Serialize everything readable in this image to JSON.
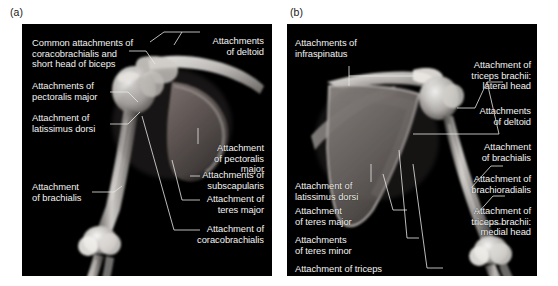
{
  "figure": {
    "type": "anatomy-radiograph-figure",
    "background_color": "#ffffff",
    "panel_background": "#000000",
    "label_text_color": "#f2f2f0",
    "leader_line_color": "#e8e8e6"
  },
  "panels": [
    {
      "letter": "(a)",
      "id": "panel-a",
      "view": "anterior view of right shoulder girdle and arm skeleton",
      "labels": [
        {
          "id": "a-coracobrachialis-biceps",
          "text": "Common attachments of\ncoracobrachialis and\nshort head of biceps",
          "align": "left"
        },
        {
          "id": "a-deltoid",
          "text": "Attachments\nof deltoid",
          "align": "right"
        },
        {
          "id": "a-pectoralis-major-left",
          "text": "Attachments of\npectoralis major",
          "align": "left"
        },
        {
          "id": "a-latissimus-dorsi",
          "text": "Attachment of\nlatissimus dorsi",
          "align": "left"
        },
        {
          "id": "a-pectoralis-major-right",
          "text": "Attachment\nof pectoralis\nmajor",
          "align": "right"
        },
        {
          "id": "a-subscapularis",
          "text": "Attachments of\nsubscapularis",
          "align": "right"
        },
        {
          "id": "a-teres-major",
          "text": "Attachment of\nteres major",
          "align": "right"
        },
        {
          "id": "a-coracobrachialis",
          "text": "Attachment of\ncoracobrachialis",
          "align": "right"
        },
        {
          "id": "a-brachialis",
          "text": "Attachment\nof brachialis",
          "align": "left"
        }
      ]
    },
    {
      "letter": "(b)",
      "id": "panel-b",
      "view": "posterior view of right shoulder girdle and arm skeleton",
      "labels": [
        {
          "id": "b-infraspinatus",
          "text": "Attachments of\ninfraspinatus",
          "align": "left"
        },
        {
          "id": "b-triceps-lateral",
          "text": "Attachment of\ntriceps brachii:\nlateral head",
          "align": "right"
        },
        {
          "id": "b-deltoid",
          "text": "Attachments\nof deltoid",
          "align": "right"
        },
        {
          "id": "b-brachialis",
          "text": "Attachment\nof brachialis",
          "align": "right"
        },
        {
          "id": "b-brachioradialis",
          "text": "Attachment of\nbrachioradialis",
          "align": "right"
        },
        {
          "id": "b-triceps-medial",
          "text": "Attachment of\ntriceps brachii:\nmedial head",
          "align": "right"
        },
        {
          "id": "b-latissimus-dorsi",
          "text": "Attachment of\nlatissimus dorsi",
          "align": "left"
        },
        {
          "id": "b-teres-major",
          "text": "Attachment\nof teres major",
          "align": "left"
        },
        {
          "id": "b-teres-minor",
          "text": "Attachments\nof teres minor",
          "align": "left"
        },
        {
          "id": "b-triceps-long",
          "text": "Attachment of triceps\nbrachii: long head",
          "align": "left"
        }
      ]
    }
  ]
}
